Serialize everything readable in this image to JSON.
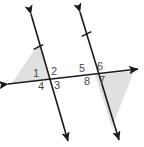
{
  "figure": {
    "background_color": "#ffffff",
    "line_color": "#1a1a1a",
    "label_color": "#4a4a4a",
    "shade_color": "#e0e0e0",
    "stroke_width": 1.6
  },
  "angles": {
    "left_intersection": {
      "top_left": "1",
      "top_right": "2",
      "bottom_left": "4",
      "bottom_right": "3"
    },
    "right_intersection": {
      "top_left": "5",
      "top_right": "6",
      "bottom_left": "8",
      "bottom_right": "7"
    }
  },
  "lines": [
    {
      "name": "left-parallel-line",
      "x1": 31,
      "y1": 14,
      "x2": 68,
      "y2": 141,
      "arrow_start": true,
      "arrow_end": true,
      "tick_mark": {
        "x": 38.4,
        "y": 47
      }
    },
    {
      "name": "right-parallel-line",
      "x1": 80,
      "y1": 12,
      "x2": 119,
      "y2": 140,
      "arrow_start": true,
      "arrow_end": true,
      "tick_mark": {
        "x": 86.5,
        "y": 34
      }
    },
    {
      "name": "transversal-line",
      "x1": 8,
      "y1": 84,
      "x2": 138,
      "y2": 69,
      "arrow_start": true,
      "arrow_end": true,
      "tick_mark": null
    }
  ],
  "shaded_regions": [
    {
      "name": "left-shaded-angle-region",
      "points": "50,79 12,83 39,43"
    },
    {
      "name": "right-shaded-angle-region",
      "points": "95,75 134,71 112,127"
    }
  ]
}
